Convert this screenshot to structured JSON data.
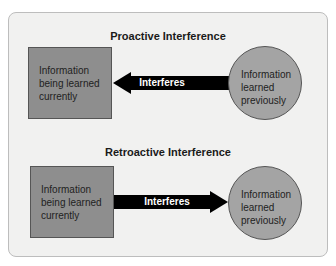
{
  "proactive": {
    "title": "Proactive Interference",
    "square_text": [
      "Information",
      "being learned",
      "currently"
    ],
    "circle_text": [
      "Information",
      "learned",
      "previously"
    ],
    "arrow_label": "Interferes",
    "arrow_direction": "left"
  },
  "retroactive": {
    "title": "Retroactive Interference",
    "square_text": [
      "Information",
      "being learned",
      "currently"
    ],
    "circle_text": [
      "Information",
      "learned",
      "previously"
    ],
    "arrow_label": "Interferes",
    "arrow_direction": "right"
  }
}
